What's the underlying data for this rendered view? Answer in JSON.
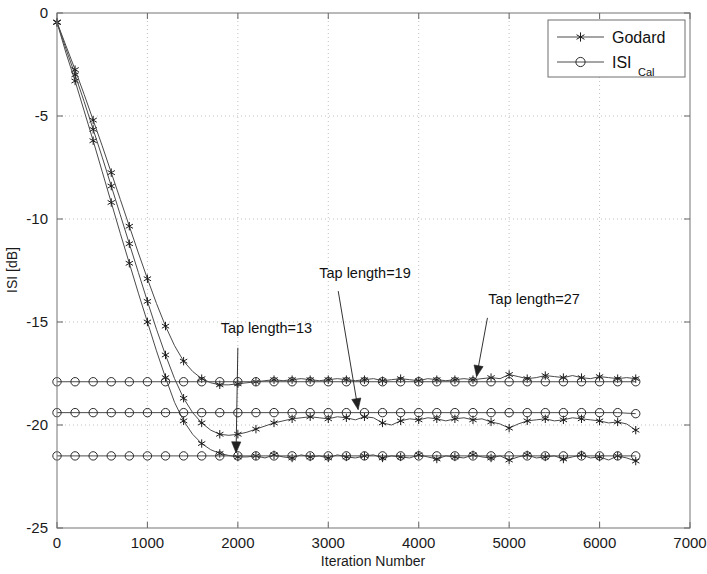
{
  "chart_data": {
    "type": "line",
    "title": "",
    "xlabel": "Iteration Number",
    "ylabel": "ISI [dB]",
    "xlim": [
      0,
      7000
    ],
    "ylim": [
      -25,
      0
    ],
    "xticks": [
      0,
      1000,
      2000,
      3000,
      4000,
      5000,
      6000,
      7000
    ],
    "xtick_labels": [
      "0",
      "1000",
      "2000",
      "3000",
      "4000",
      "5000",
      "6000",
      "7000"
    ],
    "yticks": [
      0,
      -5,
      -10,
      -15,
      -20,
      -25
    ],
    "ytick_labels": [
      "0",
      "-5",
      "-10",
      "-15",
      "-20",
      "-25"
    ],
    "grid": true,
    "grid_style": "dotted",
    "legend_position": "top-right",
    "legend": [
      {
        "name": "Godard",
        "marker": "asterisk",
        "line": "solid"
      },
      {
        "name": "ISI",
        "subscript": "Cal",
        "marker": "circle",
        "line": "solid"
      }
    ],
    "annotations": [
      {
        "label": "Tap length=13",
        "text_x": 1810,
        "text_y": -15.55,
        "arrow_from_x": 2000,
        "arrow_from_y": -16.25,
        "arrow_to_x": 1980,
        "arrow_to_y": -21.35
      },
      {
        "label": "Tap length=19",
        "text_x": 2900,
        "text_y": -12.85,
        "arrow_from_x": 3110,
        "arrow_from_y": -13.5,
        "arrow_to_x": 3330,
        "arrow_to_y": -19.25
      },
      {
        "label": "Tap length=27",
        "text_x": 4770,
        "text_y": -14.15,
        "arrow_from_x": 4760,
        "arrow_from_y": -14.8,
        "arrow_to_x": 4640,
        "arrow_to_y": -17.65
      }
    ],
    "series": [
      {
        "name": "Godard tap 13",
        "marker": "asterisk",
        "steady_state": -21.5,
        "x": [
          0,
          100,
          200,
          300,
          400,
          500,
          600,
          700,
          800,
          900,
          1000,
          1100,
          1200,
          1300,
          1400,
          1500,
          1600,
          1700,
          1800,
          1900,
          2000,
          2100,
          2200,
          2300,
          2400,
          2500,
          2600,
          2700,
          2800,
          2900,
          3000,
          3100,
          3200,
          3300,
          3400,
          3500,
          3600,
          3700,
          3800,
          3900,
          4000,
          4100,
          4200,
          4300,
          4400,
          4500,
          4600,
          4700,
          4800,
          4900,
          5000,
          5100,
          5200,
          5300,
          5400,
          5500,
          5600,
          5700,
          5800,
          5900,
          6000,
          6100,
          6200,
          6300,
          6400
        ],
        "y": [
          -0.45,
          -1.95,
          -3.3,
          -4.75,
          -6.2,
          -7.7,
          -9.2,
          -10.7,
          -12.15,
          -13.6,
          -15.0,
          -16.4,
          -17.7,
          -18.9,
          -19.8,
          -20.45,
          -20.9,
          -21.2,
          -21.38,
          -21.48,
          -21.55,
          -21.55,
          -21.5,
          -21.6,
          -21.45,
          -21.55,
          -21.6,
          -21.45,
          -21.55,
          -21.5,
          -21.6,
          -21.45,
          -21.55,
          -21.6,
          -21.5,
          -21.45,
          -21.6,
          -21.5,
          -21.55,
          -21.6,
          -21.45,
          -21.55,
          -21.65,
          -21.5,
          -21.55,
          -21.6,
          -21.45,
          -21.55,
          -21.6,
          -21.5,
          -21.7,
          -21.55,
          -21.45,
          -21.6,
          -21.55,
          -21.5,
          -21.65,
          -21.55,
          -21.45,
          -21.6,
          -21.55,
          -21.7,
          -21.5,
          -21.6,
          -21.75
        ]
      },
      {
        "name": "Godard tap 19",
        "marker": "asterisk",
        "steady_state": -19.5,
        "x": [
          0,
          100,
          200,
          300,
          400,
          500,
          600,
          700,
          800,
          900,
          1000,
          1100,
          1200,
          1300,
          1400,
          1500,
          1600,
          1700,
          1800,
          1900,
          2000,
          2100,
          2200,
          2300,
          2400,
          2500,
          2600,
          2700,
          2800,
          2900,
          3000,
          3100,
          3200,
          3300,
          3400,
          3500,
          3600,
          3700,
          3800,
          3900,
          4000,
          4100,
          4200,
          4300,
          4400,
          4500,
          4600,
          4700,
          4800,
          4900,
          5000,
          5100,
          5200,
          5300,
          5400,
          5500,
          5600,
          5700,
          5800,
          5900,
          6000,
          6100,
          6200,
          6300,
          6400
        ],
        "y": [
          -0.45,
          -1.75,
          -3.0,
          -4.3,
          -5.65,
          -7.0,
          -8.4,
          -9.8,
          -11.2,
          -12.6,
          -14.0,
          -15.35,
          -16.6,
          -17.75,
          -18.7,
          -19.4,
          -19.9,
          -20.25,
          -20.45,
          -20.5,
          -20.45,
          -20.35,
          -20.2,
          -20.05,
          -19.9,
          -19.8,
          -19.7,
          -19.65,
          -19.6,
          -19.65,
          -19.7,
          -19.6,
          -19.65,
          -19.75,
          -19.6,
          -19.65,
          -19.9,
          -20.0,
          -19.8,
          -19.7,
          -19.75,
          -19.65,
          -19.7,
          -19.8,
          -19.7,
          -19.65,
          -19.75,
          -19.7,
          -19.85,
          -19.95,
          -20.15,
          -19.95,
          -19.8,
          -19.75,
          -19.7,
          -19.8,
          -19.75,
          -19.65,
          -19.7,
          -19.75,
          -19.8,
          -19.9,
          -19.85,
          -19.95,
          -20.25
        ]
      },
      {
        "name": "Godard tap 27",
        "marker": "asterisk",
        "steady_state": -17.7,
        "x": [
          0,
          100,
          200,
          300,
          400,
          500,
          600,
          700,
          800,
          900,
          1000,
          1100,
          1200,
          1300,
          1400,
          1500,
          1600,
          1700,
          1800,
          1900,
          2000,
          2100,
          2200,
          2300,
          2400,
          2500,
          2600,
          2700,
          2800,
          2900,
          3000,
          3100,
          3200,
          3300,
          3400,
          3500,
          3600,
          3700,
          3800,
          3900,
          4000,
          4100,
          4200,
          4300,
          4400,
          4500,
          4600,
          4700,
          4800,
          4900,
          5000,
          5100,
          5200,
          5300,
          5400,
          5500,
          5600,
          5700,
          5800,
          5900,
          6000,
          6100,
          6200,
          6300,
          6400
        ],
        "y": [
          -0.45,
          -1.6,
          -2.75,
          -3.95,
          -5.2,
          -6.45,
          -7.75,
          -9.05,
          -10.35,
          -11.65,
          -12.9,
          -14.1,
          -15.2,
          -16.15,
          -16.9,
          -17.4,
          -17.75,
          -17.95,
          -18.05,
          -18.05,
          -18.0,
          -17.95,
          -17.9,
          -17.85,
          -17.8,
          -17.85,
          -17.8,
          -17.75,
          -17.8,
          -17.85,
          -17.8,
          -17.75,
          -17.8,
          -17.85,
          -17.8,
          -17.75,
          -17.85,
          -17.8,
          -17.75,
          -17.8,
          -17.85,
          -17.75,
          -17.8,
          -17.85,
          -17.8,
          -17.75,
          -17.8,
          -17.75,
          -17.7,
          -17.75,
          -17.55,
          -17.65,
          -17.75,
          -17.7,
          -17.6,
          -17.65,
          -17.7,
          -17.6,
          -17.7,
          -17.75,
          -17.65,
          -17.7,
          -17.75,
          -17.7,
          -17.75
        ]
      },
      {
        "name": "ISI Cal tap 13",
        "marker": "circle",
        "constant": -21.5,
        "x": [
          0,
          200,
          400,
          600,
          800,
          1000,
          1200,
          1400,
          1600,
          1800,
          2000,
          2200,
          2400,
          2600,
          2800,
          3000,
          3200,
          3400,
          3600,
          3800,
          4000,
          4200,
          4400,
          4600,
          4800,
          5000,
          5200,
          5400,
          5600,
          5800,
          6000,
          6200,
          6400
        ],
        "y": [
          -21.5,
          -21.5,
          -21.5,
          -21.5,
          -21.5,
          -21.5,
          -21.5,
          -21.5,
          -21.5,
          -21.5,
          -21.5,
          -21.5,
          -21.5,
          -21.5,
          -21.5,
          -21.5,
          -21.5,
          -21.5,
          -21.5,
          -21.5,
          -21.5,
          -21.5,
          -21.5,
          -21.5,
          -21.5,
          -21.5,
          -21.5,
          -21.5,
          -21.5,
          -21.5,
          -21.5,
          -21.5,
          -21.5
        ]
      },
      {
        "name": "ISI Cal tap 19",
        "marker": "circle",
        "constant": -19.4,
        "x": [
          0,
          200,
          400,
          600,
          800,
          1000,
          1200,
          1400,
          1600,
          1800,
          2000,
          2200,
          2400,
          2600,
          2800,
          3000,
          3200,
          3400,
          3600,
          3800,
          4000,
          4200,
          4400,
          4600,
          4800,
          5000,
          5200,
          5400,
          5600,
          5800,
          6000,
          6200,
          6400
        ],
        "y": [
          -19.4,
          -19.4,
          -19.4,
          -19.4,
          -19.4,
          -19.4,
          -19.4,
          -19.4,
          -19.4,
          -19.4,
          -19.4,
          -19.4,
          -19.4,
          -19.4,
          -19.4,
          -19.4,
          -19.4,
          -19.4,
          -19.4,
          -19.4,
          -19.4,
          -19.4,
          -19.4,
          -19.4,
          -19.4,
          -19.4,
          -19.4,
          -19.4,
          -19.4,
          -19.4,
          -19.4,
          -19.4,
          -19.45
        ]
      },
      {
        "name": "ISI Cal tap 27",
        "marker": "circle",
        "constant": -17.9,
        "x": [
          0,
          200,
          400,
          600,
          800,
          1000,
          1200,
          1400,
          1600,
          1800,
          2000,
          2200,
          2400,
          2600,
          2800,
          3000,
          3200,
          3400,
          3600,
          3800,
          4000,
          4200,
          4400,
          4600,
          4800,
          5000,
          5200,
          5400,
          5600,
          5800,
          6000,
          6200,
          6400
        ],
        "y": [
          -17.9,
          -17.9,
          -17.9,
          -17.9,
          -17.9,
          -17.9,
          -17.9,
          -17.9,
          -17.9,
          -17.9,
          -17.9,
          -17.9,
          -17.9,
          -17.9,
          -17.9,
          -17.9,
          -17.9,
          -17.9,
          -17.9,
          -17.9,
          -17.9,
          -17.9,
          -17.9,
          -17.9,
          -17.9,
          -17.9,
          -17.9,
          -17.9,
          -17.9,
          -17.9,
          -17.9,
          -17.9,
          -17.9
        ]
      }
    ]
  }
}
